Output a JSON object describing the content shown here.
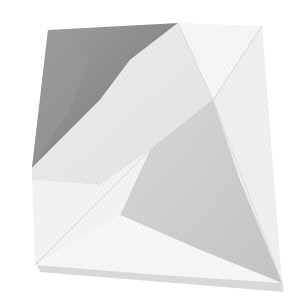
{
  "image": {
    "subject": "folded paper",
    "background_color": "#ffffff",
    "colors": {
      "dark_fold": "#8e8e8e",
      "dark_fold_light": "#a6a6a6",
      "mid_gray": "#c9c9c9",
      "light_gray": "#dcdcdc",
      "paper_white": "#f1f1f1",
      "paper_bright": "#f7f7f7",
      "shadow": "#bdbdbd"
    }
  }
}
